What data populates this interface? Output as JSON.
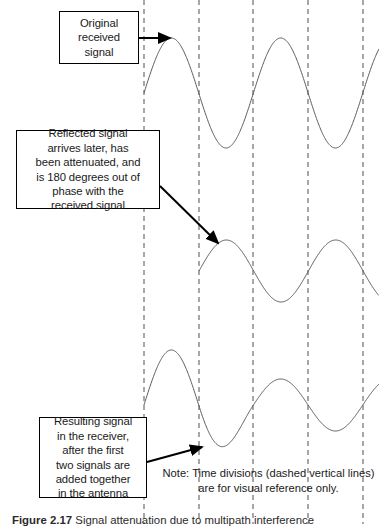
{
  "figure": {
    "caption_label": "Figure 2.17",
    "caption_text": "Signal attenuation due to multipath interference"
  },
  "callouts": {
    "original": {
      "text": "Original\nreceived\nsignal"
    },
    "reflected": {
      "text": "Reflected signal\narrives later, has\nbeen attenuated, and\nis 180 degrees out of\nphase with the\nreceived signal"
    },
    "resulting": {
      "text": "Resulting signal\nin the receiver,\nafter the first\ntwo signals are\nadded together\nin the antenna"
    }
  },
  "note": {
    "text": "Note: Time divisions (dashed vertical lines)\nare for visual reference only."
  },
  "colors": {
    "waveform": "#5a5a5a",
    "gridline": "#8a8a8a",
    "arrow": "#000000",
    "box_border": "#000000",
    "background": "#ffffff"
  },
  "chart_data": {
    "type": "line",
    "xlabel": "",
    "ylabel": "",
    "grid": true,
    "legend": "none",
    "gridlines": {
      "orientation": "vertical",
      "style": "dashed",
      "x_positions": [
        144,
        199,
        253,
        308,
        363
      ],
      "count": 5,
      "label": "Time divisions"
    },
    "plot_area": {
      "x_start": 144,
      "x_end": 379,
      "period_px": 109.4
    },
    "series": [
      {
        "name": "Original received signal",
        "row": 1,
        "baseline_y": 93,
        "amplitude": 55,
        "phase_deg": 0,
        "x_start": 144,
        "x_end": 379,
        "cycles": 2.15,
        "attenuation": 1.0
      },
      {
        "name": "Reflected signal",
        "row": 2,
        "baseline_y": 271,
        "amplitude": 31,
        "phase_deg": 0,
        "x_start": 199,
        "x_end": 379,
        "cycles": 1.65,
        "attenuation": 0.56
      },
      {
        "name": "Resulting signal in receiver",
        "row": 3,
        "baseline_y": 405,
        "amplitude_first": 55,
        "amplitude_rest": 26,
        "phase_deg": 0,
        "x_start": 144,
        "x_end": 379,
        "cycles": 2.15,
        "transition_x": 199
      }
    ],
    "arrows": [
      {
        "name": "original-arrow",
        "from": [
          139,
          38
        ],
        "to": [
          170,
          38
        ]
      },
      {
        "name": "reflected-arrow",
        "from": [
          160,
          186
        ],
        "to": [
          218,
          243
        ]
      },
      {
        "name": "resulting-arrow",
        "from": [
          147,
          462
        ],
        "to": [
          202,
          447
        ]
      }
    ]
  }
}
